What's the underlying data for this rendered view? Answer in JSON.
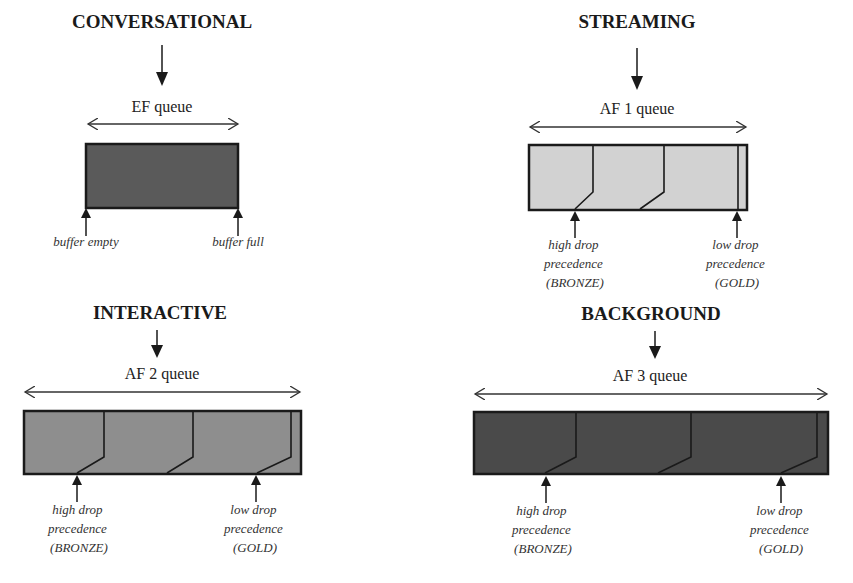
{
  "colors": {
    "conversational_fill": "#5a5a5a",
    "streaming_fill": "#d2d2d2",
    "interactive_fill": "#8e8e8e",
    "background_fill": "#4a4a4a",
    "stroke": "#1a1a1a"
  },
  "panels": {
    "conversational": {
      "title": "CONVERSATIONAL",
      "queue": "EF queue",
      "left_marker": "buffer empty",
      "right_marker": "buffer full"
    },
    "streaming": {
      "title": "STREAMING",
      "queue": "AF 1 queue",
      "left_marker": [
        "high drop",
        "precedence",
        "(BRONZE)"
      ],
      "right_marker": [
        "low drop",
        "precedence",
        "(GOLD)"
      ]
    },
    "interactive": {
      "title": "INTERACTIVE",
      "queue": "AF 2 queue",
      "left_marker": [
        "high drop",
        "precedence",
        "(BRONZE)"
      ],
      "right_marker": [
        "low drop",
        "precedence",
        "(GOLD)"
      ]
    },
    "background": {
      "title": "BACKGROUND",
      "queue": "AF 3 queue",
      "left_marker": [
        "high drop",
        "precedence",
        "(BRONZE)"
      ],
      "right_marker": [
        "low drop",
        "precedence",
        "(GOLD)"
      ]
    }
  }
}
